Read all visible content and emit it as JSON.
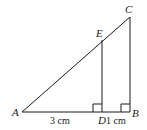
{
  "diagram": {
    "type": "geometry-similar-triangles",
    "points": {
      "A": {
        "label": "A",
        "x": 22,
        "y": 112
      },
      "B": {
        "label": "B",
        "x": 130,
        "y": 112
      },
      "C": {
        "label": "C",
        "x": 130,
        "y": 17
      },
      "D": {
        "label": "D",
        "x": 102,
        "y": 112
      },
      "E": {
        "label": "E",
        "x": 102,
        "y": 40
      }
    },
    "segments": [
      "AB",
      "BC",
      "AC",
      "DE"
    ],
    "right_angles": [
      "D",
      "B"
    ],
    "measurements": {
      "AD": "3 cm",
      "DB": "1 cm"
    },
    "stroke_color": "#1a1a1a"
  }
}
